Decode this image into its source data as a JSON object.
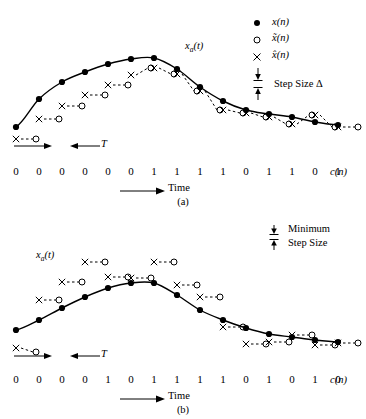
{
  "figure": {
    "legend": {
      "items": [
        {
          "symbol": "filled-circle",
          "label": "x(n)"
        },
        {
          "symbol": "open-circle",
          "label": "x̃(n)"
        },
        {
          "symbol": "cross",
          "label": "x̂(n)"
        }
      ],
      "step_size_label": "Step Size Δ"
    },
    "panel_a": {
      "caption": "(a)",
      "curve_label": "xa(t)",
      "time_label": "Time",
      "period_label": "T",
      "code_label": "c(n)",
      "bits": [
        "0",
        "0",
        "0",
        "0",
        "0",
        "0",
        "1",
        "1",
        "1",
        "1",
        "0",
        "1",
        "1",
        "0",
        "1"
      ]
    },
    "panel_b": {
      "caption": "(b)",
      "curve_label": "xa(t)",
      "time_label": "Time",
      "period_label": "T",
      "code_label": "c(n)",
      "minimum_label": "Minimum",
      "step_size_label": "Step Size",
      "bits": [
        "0",
        "0",
        "0",
        "0",
        "1",
        "0",
        "1",
        "1",
        "1",
        "1",
        "0",
        "1",
        "0",
        "1",
        "0"
      ]
    }
  },
  "chart_data": [
    {
      "type": "line",
      "title": "(a)",
      "xlabel": "Time",
      "ylabel": "",
      "series_name": "xa(t)",
      "legend_position": "top-right",
      "grid": false,
      "x": [
        16,
        39,
        62,
        85,
        108,
        131,
        154,
        177,
        200,
        223,
        246,
        269,
        292,
        315,
        338
      ],
      "samples_x_pixel": [
        16,
        39,
        62,
        85,
        108,
        131,
        154,
        177,
        200,
        223,
        246,
        269,
        292,
        315,
        338
      ],
      "samples_y_pixel": [
        127,
        99,
        82,
        72,
        64,
        59,
        58,
        69,
        87,
        101,
        110,
        114,
        117,
        122,
        125
      ],
      "quantized_cross_y_pixel": [
        139,
        119,
        106,
        95,
        85,
        75,
        68,
        74,
        91,
        110,
        113,
        117,
        124,
        115,
        127
      ],
      "predicted_circle_y_pixel": [
        139,
        119,
        106,
        95,
        85,
        68,
        74,
        91,
        110,
        113,
        117,
        124,
        115,
        127,
        127
      ],
      "code_bits": [
        0,
        0,
        0,
        0,
        0,
        0,
        1,
        1,
        1,
        1,
        0,
        1,
        1,
        0,
        1
      ],
      "annotations": [
        "xa(t)",
        "T",
        "Time",
        "c(n)",
        "Step Size Δ"
      ]
    },
    {
      "type": "line",
      "title": "(b)",
      "xlabel": "Time",
      "ylabel": "",
      "series_name": "xa(t)",
      "legend_position": "top-right",
      "grid": false,
      "x": [
        16,
        39,
        62,
        85,
        108,
        131,
        154,
        177,
        200,
        223,
        246,
        269,
        292,
        315,
        338
      ],
      "samples_x_pixel": [
        16,
        39,
        62,
        85,
        108,
        131,
        154,
        177,
        200,
        223,
        246,
        269,
        292,
        315,
        338
      ],
      "samples_y_pixel": [
        330,
        320,
        308,
        297,
        288,
        283,
        283,
        295,
        310,
        320,
        328,
        334,
        337,
        340,
        342
      ],
      "quantized_cross_y_pixel": [
        348,
        300,
        282,
        262,
        277,
        278,
        262,
        285,
        297,
        327,
        344,
        342,
        335,
        345,
        343
      ],
      "predicted_circle_y_pixel": [
        352,
        300,
        282,
        262,
        277,
        278,
        262,
        285,
        297,
        327,
        344,
        342,
        335,
        345,
        343
      ],
      "code_bits": [
        0,
        0,
        0,
        0,
        1,
        0,
        1,
        1,
        1,
        1,
        0,
        1,
        0,
        1,
        0
      ],
      "annotations": [
        "xa(t)",
        "T",
        "Time",
        "c(n)",
        "Minimum",
        "Step Size"
      ]
    }
  ]
}
